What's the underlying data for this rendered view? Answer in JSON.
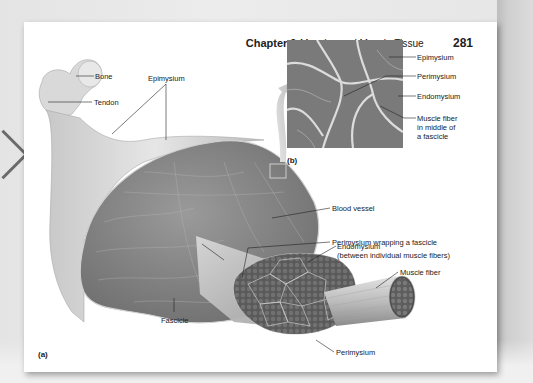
{
  "viewer": {
    "prev_page_icon": "chevron-left-icon"
  },
  "page": {
    "header": {
      "chapter": "Chapter 9",
      "title": "Muscles and Muscle Tissue",
      "page_number": "281"
    },
    "figure_a": {
      "letter": "(a)",
      "labels": {
        "bone": "Bone",
        "tendon": "Tendon",
        "epimysium": "Epimysium",
        "blood_vessel": "Blood vessel",
        "perimysium_wrapping": "Perimysium wrapping a fascicle",
        "endomysium_line1": "Endomysium",
        "endomysium_line2": "(between individual muscle fibers)",
        "muscle_fiber": "Muscle fiber",
        "fascicle": "Fascicle",
        "perimysium": "Perimysium"
      }
    },
    "figure_b": {
      "letter": "(b)",
      "labels": {
        "epimysium": "Epimysium",
        "perimysium": "Perimysium",
        "endomysium": "Endomysium",
        "muscle_fiber_middle": "Muscle fiber in middle of a fascicle"
      }
    }
  },
  "colors": {
    "page_bg": "#ffffff",
    "viewer_bg": "#e8e8e8",
    "muscle_gray": "#8a8a8a",
    "text": "#222222"
  }
}
